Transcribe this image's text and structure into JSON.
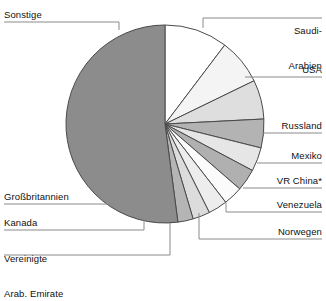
{
  "chart_data": {
    "type": "pie",
    "title": "",
    "subtitle": "",
    "xlabel": "",
    "ylabel": "",
    "legend_position": "callout-labels",
    "grid": false,
    "start_angle_deg": 0,
    "direction": "clockwise",
    "center": {
      "x": 165,
      "y": 124
    },
    "radius": 99,
    "categories": [
      "Saudi-Arabien",
      "USA",
      "Russland",
      "Mexiko",
      "VR China*",
      "Venezuela",
      "Norwegen",
      "Vereinigte Arab. Emirate",
      "Kanada",
      "Großbritannien",
      "Sonstige"
    ],
    "values": [
      10.3,
      7.5,
      6.4,
      4.7,
      3.9,
      3.6,
      3.1,
      3.1,
      2.8,
      2.5,
      52.1
    ],
    "angles_deg": [
      37.1,
      27.0,
      23.0,
      16.9,
      14.0,
      13.0,
      11.2,
      11.2,
      10.1,
      9.0,
      187.5
    ],
    "slices": [
      {
        "label": "Saudi-Arabien",
        "value": 10.3,
        "angle_deg": 37.1,
        "color": "#ffffff",
        "label_side": "right"
      },
      {
        "label": "USA",
        "value": 7.5,
        "angle_deg": 27.0,
        "color": "#f4f4f4",
        "label_side": "right"
      },
      {
        "label": "Russland",
        "value": 6.4,
        "angle_deg": 23.0,
        "color": "#dedede",
        "label_side": "right"
      },
      {
        "label": "Mexiko",
        "value": 4.7,
        "angle_deg": 16.9,
        "color": "#b3b3b3",
        "label_side": "right"
      },
      {
        "label": "VR China*",
        "value": 3.9,
        "angle_deg": 14.0,
        "color": "#e6e6e6",
        "label_side": "right"
      },
      {
        "label": "Venezuela",
        "value": 3.6,
        "angle_deg": 13.0,
        "color": "#b0b0b0",
        "label_side": "right"
      },
      {
        "label": "Norwegen",
        "value": 3.1,
        "angle_deg": 11.2,
        "color": "#fbfbfb",
        "label_side": "right"
      },
      {
        "label": "Vereinigte Arab. Emirate",
        "value": 3.1,
        "angle_deg": 11.2,
        "color": "#ededed",
        "label_side": "left"
      },
      {
        "label": "Kanada",
        "value": 2.8,
        "angle_deg": 10.1,
        "color": "#dcdcdc",
        "label_side": "left"
      },
      {
        "label": "Großbritannien",
        "value": 2.5,
        "angle_deg": 9.0,
        "color": "#b5b5b5",
        "label_side": "left"
      },
      {
        "label": "Sonstige",
        "value": 52.1,
        "angle_deg": 187.5,
        "color": "#8c8c8c",
        "label_side": "left"
      }
    ],
    "colors": {
      "stroke": "#4a4a4a",
      "leader_line": "#8a8a8a",
      "text": "#111111",
      "background": "#ffffff"
    }
  },
  "labels": {
    "saudi_arabien_line1": "Saudi-",
    "saudi_arabien_line2": "Arabien",
    "usa": "USA",
    "russland": "Russland",
    "mexiko": "Mexiko",
    "vr_china": "VR China*",
    "venezuela": "Venezuela",
    "norwegen": "Norwegen",
    "vae_line1": "Vereinigte",
    "vae_line2": "Arab. Emirate",
    "kanada": "Kanada",
    "grossbritannien": "Großbritannien",
    "sonstige": "Sonstige"
  }
}
